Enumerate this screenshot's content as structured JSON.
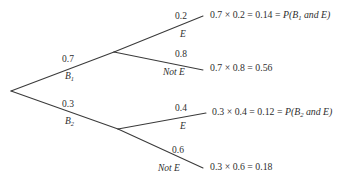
{
  "diagram": {
    "type": "probability-tree",
    "background_color": "#ffffff",
    "line_color": "#3a3a3a",
    "text_color": "#2e2e2e"
  },
  "branches": {
    "b1": {
      "probability": "0.7",
      "event_label": "B",
      "event_sub": "1"
    },
    "b2": {
      "probability": "0.3",
      "event_label": "B",
      "event_sub": "2"
    },
    "b1_e": {
      "probability": "0.2",
      "event_label": "E"
    },
    "b1_note": {
      "probability": "0.8",
      "event_label": "Not E"
    },
    "b2_e": {
      "probability": "0.4",
      "event_label": "E"
    },
    "b2_note": {
      "probability": "0.6",
      "event_label": "Not E"
    }
  },
  "results": {
    "row1": {
      "expression": "0.7 × 0.2 = 0.14 = ",
      "notation_prefix": "P(B",
      "notation_sub": "1",
      "notation_suffix": " and E)"
    },
    "row2": {
      "expression": "0.7 × 0.8 = 0.56",
      "notation_prefix": "",
      "notation_sub": "",
      "notation_suffix": ""
    },
    "row3": {
      "expression": "0.3 × 0.4 = 0.12 = ",
      "notation_prefix": "P(B",
      "notation_sub": "2",
      "notation_suffix": " and E)"
    },
    "row4": {
      "expression": "0.3 × 0.6 = 0.18",
      "notation_prefix": "",
      "notation_sub": "",
      "notation_suffix": ""
    }
  }
}
